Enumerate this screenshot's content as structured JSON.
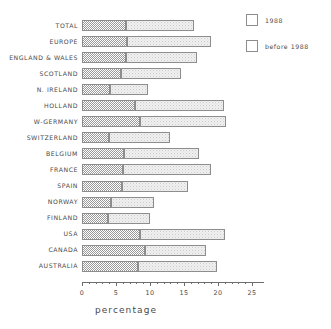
{
  "chart_data": {
    "type": "bar",
    "orientation": "horizontal",
    "stacked": true,
    "title": "",
    "xlabel": "percentage",
    "ylabel": "",
    "xlim": [
      0,
      25
    ],
    "xticks": [
      0,
      5,
      10,
      15,
      20,
      25
    ],
    "xtick_labels": [
      "0",
      "5",
      "10",
      "15",
      "20",
      "25"
    ],
    "minor_ticks": [
      1,
      2,
      3,
      4,
      6,
      7,
      8,
      9,
      11,
      12,
      13,
      14,
      16,
      17,
      18,
      19,
      21,
      22,
      23,
      24
    ],
    "grid": false,
    "legend_position": "top-right",
    "categories": [
      "TOTAL",
      "EUROPE",
      "ENGLAND & WALES",
      "SCOTLAND",
      "N. IRELAND",
      "HOLLAND",
      "W-GERMANY",
      "SWITZERLAND",
      "BELGIUM",
      "FRANCE",
      "SPAIN",
      "NORWAY",
      "FINLAND",
      "USA",
      "CANADA",
      "AUSTRALIA"
    ],
    "series": [
      {
        "name": "1988",
        "color": "#9a9a9a",
        "pattern": "dense-checker",
        "values": [
          6.5,
          6.6,
          6.5,
          5.7,
          4.1,
          7.8,
          8.5,
          4.0,
          6.2,
          6.0,
          5.9,
          4.3,
          3.8,
          8.5,
          9.2,
          8.2
        ]
      },
      {
        "name": "before 1988",
        "color": "#f0f0f0",
        "pattern": "sparse-dither",
        "values": [
          10.0,
          12.4,
          10.4,
          8.9,
          5.6,
          13.1,
          12.7,
          9.0,
          11.0,
          13.0,
          9.7,
          6.3,
          6.2,
          12.5,
          9.0,
          11.7
        ]
      }
    ],
    "totals": [
      16.5,
      19.0,
      16.9,
      14.6,
      9.7,
      20.9,
      21.2,
      13.0,
      17.2,
      19.0,
      15.6,
      10.6,
      10.0,
      21.0,
      18.2,
      19.9
    ]
  },
  "legend": {
    "entries": [
      {
        "label": "1988"
      },
      {
        "label": "before 1988"
      }
    ]
  }
}
